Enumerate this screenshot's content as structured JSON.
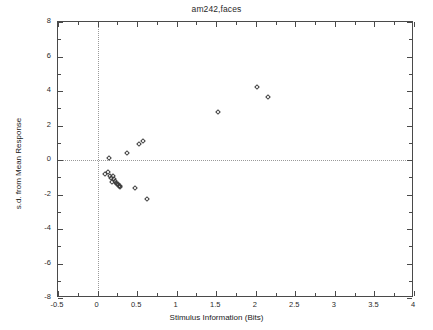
{
  "chart_data": {
    "type": "scatter",
    "title": "am242,faces",
    "xlabel": "Stimulus Information (Bits)",
    "ylabel": "s.d. from Mean Response",
    "xlim": [
      -0.5,
      4
    ],
    "ylim": [
      -8,
      8
    ],
    "xticks": [
      -0.5,
      0,
      0.5,
      1,
      1.5,
      2,
      2.5,
      3,
      3.5,
      4
    ],
    "xticklabels": [
      "-0.5",
      "0",
      "0.5",
      "1",
      "1.5",
      "2",
      "2.5",
      "3",
      "3.5",
      "4"
    ],
    "yticks": [
      -8,
      -6,
      -4,
      -2,
      0,
      2,
      4,
      6,
      8
    ],
    "yticklabels": [
      "-8",
      "-6",
      "-4",
      "-2",
      "0",
      "2",
      "4",
      "6",
      "8"
    ],
    "grid": false,
    "reference_lines": [
      {
        "axis": "y",
        "value": 0,
        "style": "dotted"
      },
      {
        "axis": "x",
        "value": 0,
        "style": "dotted"
      }
    ],
    "legend": null,
    "marker": "open-diamond",
    "marker_color": "#3c3c3c",
    "points": [
      {
        "x": 0.09,
        "y": -0.8
      },
      {
        "x": 0.13,
        "y": -0.72
      },
      {
        "x": 0.14,
        "y": 0.12
      },
      {
        "x": 0.16,
        "y": -0.95
      },
      {
        "x": 0.17,
        "y": -1.05
      },
      {
        "x": 0.18,
        "y": -1.28
      },
      {
        "x": 0.2,
        "y": -0.9
      },
      {
        "x": 0.21,
        "y": -1.12
      },
      {
        "x": 0.22,
        "y": -1.2
      },
      {
        "x": 0.23,
        "y": -1.32
      },
      {
        "x": 0.24,
        "y": -1.42
      },
      {
        "x": 0.26,
        "y": -1.38
      },
      {
        "x": 0.27,
        "y": -1.5
      },
      {
        "x": 0.28,
        "y": -1.55
      },
      {
        "x": 0.29,
        "y": -1.48
      },
      {
        "x": 0.37,
        "y": 0.42
      },
      {
        "x": 0.47,
        "y": -1.62
      },
      {
        "x": 0.52,
        "y": 0.92
      },
      {
        "x": 0.57,
        "y": 1.1
      },
      {
        "x": 0.63,
        "y": -2.28
      },
      {
        "x": 1.52,
        "y": 2.8
      },
      {
        "x": 2.02,
        "y": 4.26
      },
      {
        "x": 2.15,
        "y": 3.65
      }
    ]
  }
}
